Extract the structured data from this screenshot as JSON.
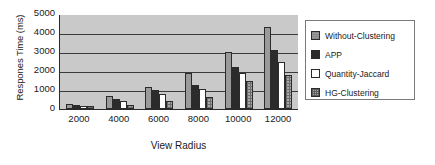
{
  "chart_data": {
    "type": "bar",
    "title": "",
    "xlabel": "View Radius",
    "ylabel": "Respones Time (ms)",
    "categories": [
      "2000",
      "4000",
      "6000",
      "8000",
      "10000",
      "12000"
    ],
    "yticks": [
      "5000",
      "4000",
      "3000",
      "2000",
      "1000",
      "0"
    ],
    "ylim": [
      0,
      5000
    ],
    "grid": true,
    "legend_position": "right",
    "series": [
      {
        "name": "Without-Clustering",
        "color": "#9a9a9a",
        "values": [
          250,
          700,
          1150,
          1900,
          3000,
          4300
        ]
      },
      {
        "name": "APP",
        "color": "#2b2b2b",
        "values": [
          230,
          520,
          980,
          1250,
          2200,
          3100
        ]
      },
      {
        "name": "Quantity-Jaccard",
        "color": "#ffffff",
        "values": [
          180,
          430,
          800,
          1050,
          1900,
          2450
        ]
      },
      {
        "name": "HG-Clustering",
        "color": "#a8a8a8",
        "values": [
          150,
          230,
          400,
          620,
          1500,
          1800
        ]
      }
    ]
  },
  "legend": {
    "items": [
      {
        "label": "Without-Clustering"
      },
      {
        "label": "APP"
      },
      {
        "label": "Quantity-Jaccard"
      },
      {
        "label": "HG-Clustering"
      }
    ]
  }
}
